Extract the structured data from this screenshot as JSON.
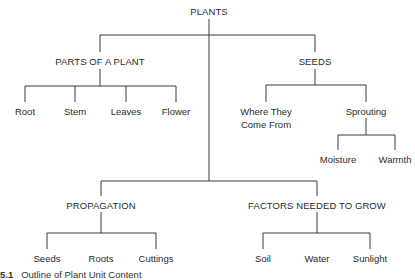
{
  "diagram": {
    "root": "PLANTS",
    "branches": [
      {
        "label": "PARTS OF A PLANT",
        "children": [
          "Root",
          "Stem",
          "Leaves",
          "Flower"
        ]
      },
      {
        "label": "SEEDS",
        "children": [
          {
            "label": "Where They\nCome From",
            "line1": "Where They",
            "line2": "Come From"
          },
          {
            "label": "Sprouting",
            "children": [
              "Moisture",
              "Warmth"
            ]
          }
        ]
      },
      {
        "label": "PROPAGATION",
        "children": [
          "Seeds",
          "Roots",
          "Cuttings"
        ]
      },
      {
        "label": "FACTORS NEEDED TO GROW",
        "children": [
          "Soil",
          "Water",
          "Sunlight"
        ]
      }
    ],
    "caption": {
      "number": "5.1",
      "text": "Outline of Plant Unit Content"
    }
  }
}
